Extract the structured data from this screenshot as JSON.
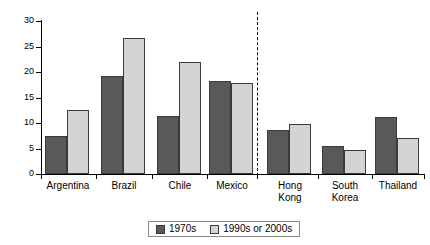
{
  "chart_data": {
    "type": "bar",
    "title": "",
    "xlabel": "",
    "ylabel": "",
    "ylim": [
      0,
      30
    ],
    "yticks": [
      0,
      5,
      10,
      15,
      20,
      25,
      30
    ],
    "grid": false,
    "legend_position": "bottom",
    "categories": [
      "Argentina",
      "Brazil",
      "Chile",
      "Mexico",
      "Hong Kong",
      "South Korea",
      "Thailand"
    ],
    "category_lines": [
      [
        "Argentina"
      ],
      [
        "Brazil"
      ],
      [
        "Chile"
      ],
      [
        "Mexico"
      ],
      [
        "Hong",
        "Kong"
      ],
      [
        "South",
        "Korea"
      ],
      [
        "Thailand"
      ]
    ],
    "series": [
      {
        "name": "1970s",
        "color": "#595959",
        "values": [
          7.5,
          19.2,
          11.4,
          18.3,
          8.7,
          5.4,
          11.1
        ]
      },
      {
        "name": "1990s or 2000s",
        "color": "#d4d4d4",
        "values": [
          12.6,
          26.7,
          22.0,
          17.9,
          9.9,
          4.8,
          7.1
        ]
      }
    ],
    "annotations": [
      {
        "type": "vertical-dashed-divider",
        "after_category": "Mexico"
      }
    ]
  },
  "legend": {
    "items": [
      {
        "label": "1970s",
        "color": "#595959"
      },
      {
        "label": "1990s or 2000s",
        "color": "#d4d4d4"
      }
    ]
  },
  "axis": {
    "y_tick_labels": [
      "30",
      "25",
      "20",
      "15",
      "10",
      "5",
      "0"
    ]
  }
}
